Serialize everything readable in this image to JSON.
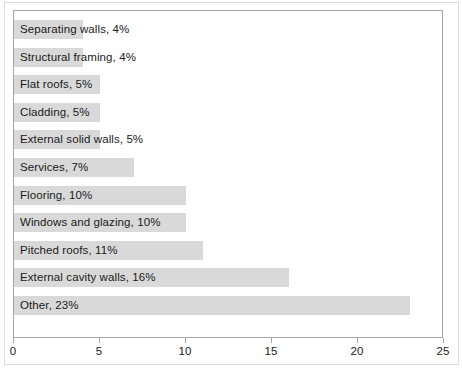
{
  "chart_data": {
    "type": "bar",
    "orientation": "horizontal",
    "title": "",
    "subtitle": "",
    "xlabel": "",
    "ylabel": "",
    "xlim": [
      0,
      25
    ],
    "xticks": [
      "0",
      "5",
      "10",
      "15",
      "20",
      "25"
    ],
    "grid": false,
    "legend": "none",
    "bar_color": "#d9d9d9",
    "categories": [
      "Separating walls",
      "Structural framing",
      "Flat roofs",
      "Cladding",
      "External solid walls",
      "Services",
      "Flooring",
      "Windows and glazing",
      "Pitched roofs",
      "External cavity walls",
      "Other"
    ],
    "values": [
      4,
      4,
      5,
      5,
      5,
      7,
      10,
      10,
      11,
      16,
      23
    ],
    "data_labels": [
      "Separating walls, 4%",
      "Structural framing, 4%",
      "Flat roofs, 5%",
      "Cladding, 5%",
      "External solid walls, 5%",
      "Services, 7%",
      "Flooring, 10%",
      "Windows and glazing, 10%",
      "Pitched roofs, 11%",
      "External cavity walls, 16%",
      "Other, 23%"
    ]
  }
}
